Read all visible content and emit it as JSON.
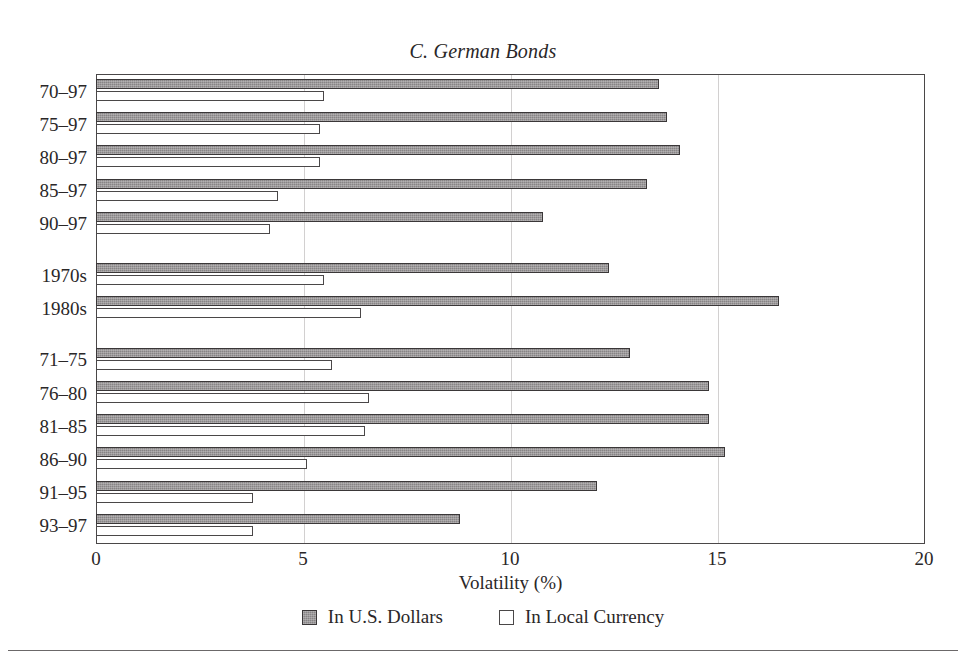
{
  "chart_data": {
    "type": "bar",
    "orientation": "horizontal",
    "title": "C. German Bonds",
    "xlabel": "Volatility (%)",
    "ylabel": "",
    "xlim": [
      0,
      20
    ],
    "xticks": [
      0,
      5,
      10,
      15,
      20
    ],
    "xtick_labels": [
      "0",
      "5",
      "10",
      "15",
      "20"
    ],
    "grid": "vertical gridlines at 5, 10, 15",
    "legend_position": "bottom-center",
    "categories": [
      "70–97",
      "75–97",
      "80–97",
      "85–97",
      "90–97",
      "1970s",
      "1980s",
      "71–75",
      "76–80",
      "81–85",
      "86–90",
      "91–95",
      "93–97"
    ],
    "group_breaks_after": [
      "90–97",
      "1980s"
    ],
    "series": [
      {
        "name": "In U.S. Dollars",
        "color": "#878485",
        "values": [
          13.6,
          13.8,
          14.1,
          13.3,
          10.8,
          12.4,
          16.5,
          12.9,
          14.8,
          14.8,
          15.2,
          12.1,
          8.8
        ]
      },
      {
        "name": "In Local Currency",
        "color": "#ffffff",
        "values": [
          5.5,
          5.4,
          5.4,
          4.4,
          4.2,
          5.5,
          6.4,
          5.7,
          6.6,
          6.5,
          5.1,
          3.8,
          3.8
        ]
      }
    ]
  },
  "legend": {
    "items": [
      {
        "label": "In U.S. Dollars",
        "swatch": "filled-gray-swatch"
      },
      {
        "label": "In Local Currency",
        "swatch": "open-white-swatch"
      }
    ]
  }
}
